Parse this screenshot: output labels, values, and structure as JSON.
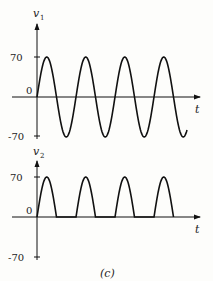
{
  "figure": {
    "caption": "(c)"
  },
  "plots": [
    {
      "id": "v1",
      "ylabel_main": "v",
      "ylabel_sub": "1",
      "xlabel": "t",
      "ticks": {
        "top": "70",
        "zero": "0",
        "bottom": "-70"
      }
    },
    {
      "id": "v2",
      "ylabel_main": "v",
      "ylabel_sub": "2",
      "xlabel": "t",
      "ticks": {
        "top": "70",
        "zero": "0",
        "bottom": "-70"
      }
    }
  ],
  "chart_data": [
    {
      "type": "line",
      "title": "v1 vs t",
      "xlabel": "t",
      "ylabel": "v1",
      "ylim": [
        -70,
        70
      ],
      "yticks": [
        -70,
        0,
        70
      ],
      "description": "Full sinusoid, amplitude 70, approx 3.9 periods shown starting at 0",
      "amplitude": 70,
      "periods_shown": 3.85
    },
    {
      "type": "line",
      "title": "v2 vs t",
      "xlabel": "t",
      "ylabel": "v2",
      "ylim": [
        -70,
        70
      ],
      "yticks": [
        -70,
        0,
        70
      ],
      "description": "Half-wave rectified sinusoid, peaks at 70, zero during negative half cycles, 4 pulses",
      "amplitude": 70,
      "pulses": 4
    }
  ]
}
